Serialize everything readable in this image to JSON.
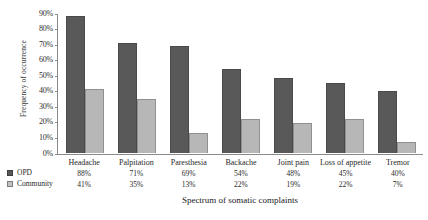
{
  "chart_data": {
    "type": "bar",
    "title": "",
    "xlabel": "Spectrum of somatic complaints",
    "ylabel": "Frequency of occurrence",
    "ylim": [
      0,
      90
    ],
    "grid": false,
    "legend_position": "bottom-left",
    "categories": [
      "Headache",
      "Palpitation",
      "Paresthesia",
      "Backache",
      "Joint pain",
      "Loss of appetite",
      "Tremor"
    ],
    "ticks": [
      "0%",
      "10%",
      "20%",
      "30%",
      "40%",
      "50%",
      "60%",
      "70%",
      "80%",
      "90%"
    ],
    "tick_values": [
      0,
      10,
      20,
      30,
      40,
      50,
      60,
      70,
      80,
      90
    ],
    "series": [
      {
        "name": "OPD",
        "color": "#595959",
        "values": [
          88,
          71,
          69,
          54,
          48,
          45,
          40
        ],
        "labels": [
          "88%",
          "71%",
          "69%",
          "54%",
          "48%",
          "45%",
          "40%"
        ]
      },
      {
        "name": "Community",
        "color": "#b7b7b7",
        "values": [
          41,
          35,
          13,
          22,
          19,
          22,
          7
        ],
        "labels": [
          "41%",
          "35%",
          "13%",
          "22%",
          "19%",
          "22%",
          "7%"
        ]
      }
    ]
  }
}
